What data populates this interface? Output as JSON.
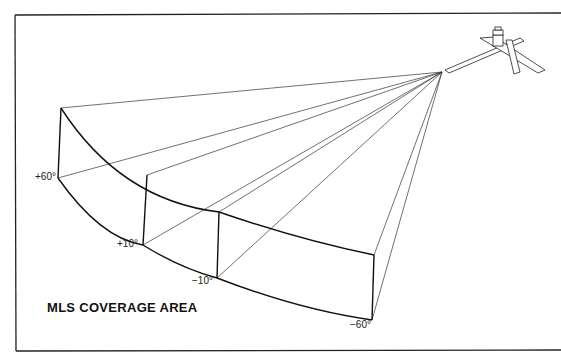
{
  "title": "MLS COVERAGE AREA",
  "angle_labels": {
    "plus60": "+60°",
    "plus10": "+10°",
    "minus10": "−10°",
    "minus60": "−60°"
  },
  "icons": {
    "station": "airport-runway-icon"
  },
  "colors": {
    "line": "#111111",
    "background": "#ffffff"
  }
}
